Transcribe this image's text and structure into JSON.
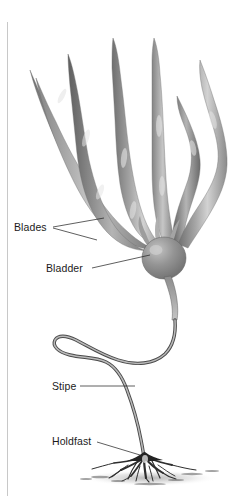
{
  "figure": {
    "background_color": "#ffffff",
    "margin_rule_color": "#c8c8c8",
    "labels": [
      {
        "id": "blades",
        "text": "Blades",
        "text_x": 14,
        "text_y": 231,
        "leaders": [
          {
            "x1": 53,
            "y1": 227,
            "x2": 104,
            "y2": 218
          },
          {
            "x1": 53,
            "y1": 228,
            "x2": 97,
            "y2": 240
          }
        ]
      },
      {
        "id": "bladder",
        "text": "Bladder",
        "text_x": 46,
        "text_y": 272,
        "leaders": [
          {
            "x1": 92,
            "y1": 268,
            "x2": 150,
            "y2": 255
          }
        ]
      },
      {
        "id": "stipe",
        "text": "Stipe",
        "text_x": 52,
        "text_y": 390,
        "leaders": [
          {
            "x1": 80,
            "y1": 386,
            "x2": 135,
            "y2": 386
          }
        ]
      },
      {
        "id": "holdfast",
        "text": "Holdfast",
        "text_x": 52,
        "text_y": 445,
        "leaders": [
          {
            "x1": 97,
            "y1": 442,
            "x2": 140,
            "y2": 455
          }
        ]
      }
    ],
    "colors": {
      "blade_light": "#c9c9c9",
      "blade_mid": "#9a9a9a",
      "blade_dark": "#6e6e6e",
      "bladder_fill": "#8a8a8a",
      "bladder_highlight": "#b8b8b8",
      "stipe_stroke": "#4a4a4a",
      "holdfast": "#2e2e2e",
      "ground_shadow": "#bdbdbd",
      "text": "#1b1b1b"
    }
  }
}
